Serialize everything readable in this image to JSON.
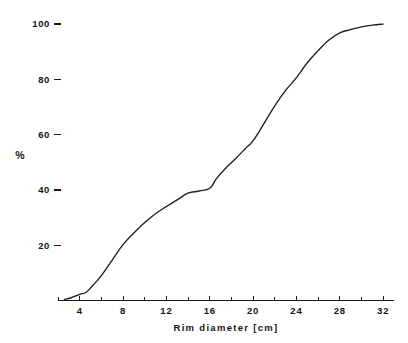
{
  "chart_data": {
    "type": "line",
    "title": "",
    "subtitle": "",
    "xlabel": "Rim diameter  [cm]",
    "ylabel": "%",
    "xlim": [
      2,
      33
    ],
    "ylim": [
      0,
      104
    ],
    "grid": false,
    "legend": "none",
    "x_ticks": [
      4,
      8,
      12,
      16,
      20,
      24,
      28,
      32
    ],
    "x_tick_labels": [
      "4",
      "8",
      "12",
      "16",
      "20",
      "24",
      "28",
      "32"
    ],
    "x_minor_tick_step": 2,
    "y_ticks": [
      20,
      40,
      60,
      80,
      100
    ],
    "y_tick_labels": [
      "20",
      "40",
      "60",
      "80",
      "100"
    ],
    "series": [
      {
        "name": "cumulative percentage",
        "color": "#1f1f1f",
        "x": [
          2.6,
          3.2,
          4.0,
          4.6,
          5.2,
          6.0,
          7.0,
          8.0,
          9.0,
          10.0,
          11.0,
          12.0,
          13.0,
          14.0,
          15.0,
          16.0,
          16.6,
          17.4,
          18.4,
          19.4,
          20.0,
          21.0,
          22.0,
          23.0,
          24.0,
          25.0,
          26.0,
          27.0,
          28.0,
          29.0,
          30.0,
          31.0,
          32.0
        ],
        "y": [
          0.4,
          1.0,
          2.2,
          3.0,
          5.4,
          9.0,
          14.6,
          20.2,
          24.4,
          28.2,
          31.4,
          34.0,
          36.4,
          38.8,
          39.6,
          40.6,
          44.0,
          47.6,
          51.4,
          55.4,
          57.8,
          64.0,
          70.4,
          76.0,
          80.6,
          86.0,
          90.4,
          94.2,
          96.8,
          98.0,
          99.0,
          99.6,
          100.0
        ]
      }
    ],
    "annotations": []
  },
  "axes": {
    "y_axis_name": "%",
    "x_axis_name": "Rim diameter  [cm]"
  },
  "colors": {
    "background": "#ffffff",
    "ink": "#141414",
    "curve": "#1f1f1f",
    "axis": "#1a1a1a"
  }
}
